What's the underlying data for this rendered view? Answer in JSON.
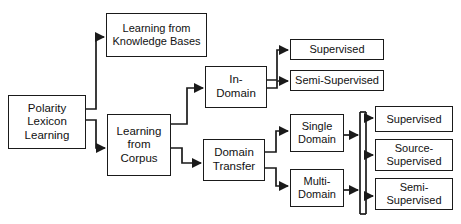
{
  "diagram": {
    "line_color": "#1a1a1a",
    "box_fill": "#ffffff",
    "nodes": {
      "root": "Polarity\nLexicon\nLearning",
      "knowledge_bases": "Learning from\nKnowledge Bases",
      "corpus": "Learning\nfrom\nCorpus",
      "in_domain": "In-\nDomain",
      "domain_transfer": "Domain\nTransfer",
      "supervised_top": "Supervised",
      "semi_supervised_top": "Semi-Supervised",
      "single_domain": "Single\nDomain",
      "multi_domain": "Multi-\nDomain",
      "supervised_right": "Supervised",
      "source_supervised_right": "Source-\nSupervised",
      "semi_supervised_right": "Semi-\nSupervised"
    },
    "edges": [
      {
        "from": "root",
        "to": "knowledge_bases"
      },
      {
        "from": "root",
        "to": "corpus"
      },
      {
        "from": "corpus",
        "to": "in_domain"
      },
      {
        "from": "corpus",
        "to": "domain_transfer"
      },
      {
        "from": "in_domain",
        "to": "supervised_top"
      },
      {
        "from": "in_domain",
        "to": "semi_supervised_top"
      },
      {
        "from": "domain_transfer",
        "to": "single_domain"
      },
      {
        "from": "domain_transfer",
        "to": "multi_domain"
      },
      {
        "from": "single_domain",
        "to": "bus"
      },
      {
        "from": "multi_domain",
        "to": "bus"
      },
      {
        "from": "bus",
        "to": "supervised_right"
      },
      {
        "from": "bus",
        "to": "source_supervised_right"
      },
      {
        "from": "bus",
        "to": "semi_supervised_right"
      }
    ]
  }
}
